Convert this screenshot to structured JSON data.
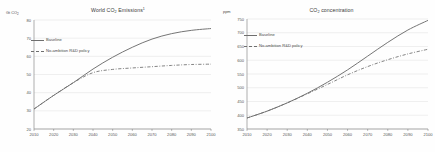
{
  "charts": [
    {
      "id": "world-co2-emissions",
      "title_main": "World CO",
      "title_sub": "2",
      "title_tail": " Emissions",
      "title_sup": "1",
      "unit_main": "Gt CO",
      "unit_sub": "2",
      "legend": [
        {
          "label": "Baseline",
          "style": "solid"
        },
        {
          "label": "No-ambition R&D policy",
          "style": "dashed"
        }
      ]
    },
    {
      "id": "co2-concentration",
      "title_main": "CO",
      "title_sub": "2",
      "title_tail": " concentration",
      "title_sup": "",
      "unit_main": "ppm",
      "unit_sub": "",
      "legend": [
        {
          "label": "Baseline",
          "style": "solid"
        },
        {
          "label": "No-ambition R&D policy",
          "style": "dashed"
        }
      ]
    }
  ],
  "chart_data": [
    {
      "type": "line",
      "title": "World CO2 Emissions",
      "xlabel": "",
      "ylabel": "Gt CO2",
      "xlim": [
        2010,
        2100
      ],
      "ylim": [
        20,
        80
      ],
      "grid": true,
      "legend_position": "upper-left",
      "x": [
        2010,
        2020,
        2030,
        2040,
        2050,
        2060,
        2070,
        2080,
        2090,
        2100
      ],
      "xticks": [
        2010,
        2020,
        2030,
        2040,
        2050,
        2060,
        2070,
        2080,
        2090,
        2100
      ],
      "yticks": [
        20,
        30,
        40,
        50,
        60,
        70,
        80
      ],
      "series": [
        {
          "name": "Baseline",
          "style": "solid",
          "values": [
            31.0,
            38.5,
            45.5,
            53.0,
            59.5,
            65.0,
            69.5,
            72.5,
            74.3,
            75.3
          ]
        },
        {
          "name": "No-ambition R&D policy",
          "style": "dashed",
          "values": [
            31.0,
            38.5,
            45.5,
            51.0,
            52.8,
            53.6,
            54.3,
            55.0,
            55.5,
            55.7
          ]
        }
      ]
    },
    {
      "type": "line",
      "title": "CO2 concentration",
      "xlabel": "",
      "ylabel": "ppm",
      "xlim": [
        2010,
        2100
      ],
      "ylim": [
        350,
        750
      ],
      "grid": true,
      "legend_position": "upper-left",
      "x": [
        2010,
        2020,
        2030,
        2040,
        2050,
        2060,
        2070,
        2080,
        2090,
        2100
      ],
      "xticks": [
        2010,
        2020,
        2030,
        2040,
        2050,
        2060,
        2070,
        2080,
        2090,
        2100
      ],
      "yticks": [
        350,
        400,
        450,
        500,
        550,
        600,
        650,
        700,
        750
      ],
      "series": [
        {
          "name": "Baseline",
          "style": "solid",
          "values": [
            390,
            415,
            445,
            480,
            520,
            565,
            615,
            665,
            710,
            745
          ]
        },
        {
          "name": "No-ambition R&D policy",
          "style": "dashed",
          "values": [
            390,
            415,
            445,
            478,
            512,
            547,
            577,
            602,
            623,
            640
          ]
        }
      ]
    }
  ]
}
